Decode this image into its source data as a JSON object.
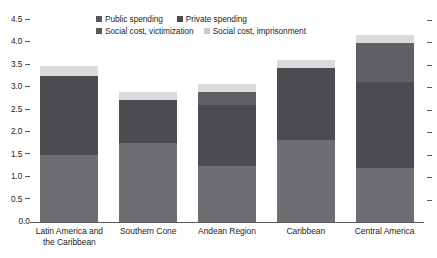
{
  "chart_data": {
    "type": "bar",
    "stacked": true,
    "title": "",
    "subtitle": "",
    "xlabel": "",
    "ylabel": "",
    "ylim": [
      0.0,
      4.5
    ],
    "ytick_labels": [
      "4.5",
      "4.0",
      "3.5",
      "3.0",
      "2.5",
      "2.0",
      "1.5",
      "1.0",
      "0.5",
      "0.0"
    ],
    "ytick_values": [
      4.5,
      4.0,
      3.5,
      3.0,
      2.5,
      2.0,
      1.5,
      1.0,
      0.5,
      0.0
    ],
    "grid": false,
    "legend_position": "top-center",
    "categories": [
      "Latin America and the Caribbean",
      "Southern Cone",
      "Andean Region",
      "Caribbean",
      "Central America"
    ],
    "category_labels": [
      [
        "Latin America and",
        "the Caribbean"
      ],
      [
        "Southern Cone"
      ],
      [
        "Andean Region"
      ],
      [
        "Caribbean"
      ],
      [
        "Central America"
      ]
    ],
    "series": [
      {
        "name": "Public spending",
        "color": "#6d6e71",
        "values": [
          1.5,
          1.76,
          1.25,
          1.83,
          1.2
        ]
      },
      {
        "name": "Private spending",
        "color": "#4b4c4f",
        "values": [
          1.75,
          0.96,
          1.36,
          1.6,
          1.91
        ]
      },
      {
        "name": "Social cost, victimization",
        "color": "#5f6063",
        "values": [
          0.0,
          0.0,
          0.29,
          0.0,
          0.87
        ]
      },
      {
        "name": "Social cost, imprisonment",
        "color": "#d9dadb",
        "values": [
          0.22,
          0.18,
          0.18,
          0.18,
          0.18
        ]
      }
    ],
    "totals": [
      3.47,
      2.9,
      3.08,
      3.61,
      4.16
    ]
  },
  "legend": {
    "rows": [
      [
        {
          "label": "Public spending",
          "color": "#58595b"
        },
        {
          "label": "Private spending",
          "color": "#4b4c4f"
        }
      ],
      [
        {
          "label": "Social cost, victimization",
          "color": "#58595b"
        },
        {
          "label": "Social cost, imprisonment",
          "color": "#c9cacb"
        }
      ]
    ]
  },
  "axis": {
    "line_color": "#58595b",
    "tick_color": "#58595b"
  }
}
